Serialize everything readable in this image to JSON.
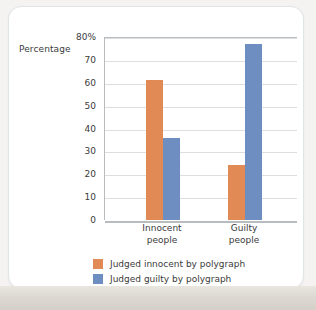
{
  "chart_data": {
    "type": "bar",
    "title": "",
    "xlabel": "",
    "ylabel": "Percentage",
    "ylim": [
      0,
      80
    ],
    "ytick_labels": [
      "0",
      "10",
      "20",
      "30",
      "40",
      "50",
      "60",
      "70",
      "80%"
    ],
    "ytick_values": [
      0,
      10,
      20,
      30,
      40,
      50,
      60,
      70,
      80
    ],
    "grid": true,
    "legend_position": "bottom",
    "categories": [
      "Innocent people",
      "Guilty people"
    ],
    "category_lines": [
      [
        "Innocent",
        "people"
      ],
      [
        "Guilty",
        "people"
      ]
    ],
    "series": [
      {
        "name": "Judged innocent by polygraph",
        "color": "#e28a55",
        "values": [
          61,
          24
        ]
      },
      {
        "name": "Judged guilty by polygraph",
        "color": "#6e8ec2",
        "values": [
          36,
          77
        ]
      }
    ]
  },
  "axis": {
    "y_title": "Percentage"
  },
  "colors": {
    "series_orange": "#e28a55",
    "series_blue": "#6e8ec2",
    "gridline": "#dcdedf",
    "axis_line": "#b9bcbe",
    "card_background": "#ffffff",
    "card_border": "#dfe4e6",
    "page_background": "#f4f3f1",
    "text": "#3b3b3b"
  }
}
